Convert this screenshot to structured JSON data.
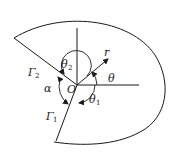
{
  "diagram": {
    "type": "geometry-sector-domain",
    "labels": {
      "origin": "O",
      "radius": "r",
      "angle_theta": "θ",
      "angle_theta1": "θ",
      "angle_theta1_sub": "1",
      "angle_theta2": "θ",
      "angle_theta2_sub": "2",
      "angle_alpha": "α",
      "boundary_gamma1": "Γ",
      "boundary_gamma1_sub": "1",
      "boundary_gamma2": "Γ",
      "boundary_gamma2_sub": "2"
    },
    "colors": {
      "stroke": "#1a1a1a",
      "background": "#ffffff"
    }
  }
}
